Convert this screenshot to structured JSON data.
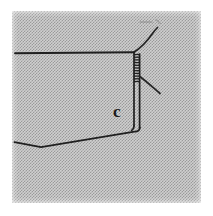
{
  "figure": {
    "kind": "scanned-line-drawing",
    "caption_label": "c",
    "background": {
      "paper_color": "#ffffff",
      "scan_field_color": "#cfcfcf",
      "dither_color": "#787878",
      "field_x": 12,
      "field_y": 11,
      "field_width": 189,
      "field_height": 192
    },
    "ink_color": "#1f1f1f",
    "faint_ink_color": "#8a8a8a",
    "parts": [
      {
        "name": "top-horizontal-edge",
        "description": "long dark horizontal line across upper area",
        "points": "15,53 133,52"
      },
      {
        "name": "zipper-stitch-column",
        "description": "two close parallel vertical lines with short horizontal rungs, zipper/stitching",
        "x_left": 133,
        "x_right": 140,
        "y_top": 53,
        "y_bottom": 82,
        "rung_count": 11
      },
      {
        "name": "inner-vertical-edge",
        "description": "vertical line continuing down from the stitch column",
        "points": "134,82 134,126"
      },
      {
        "name": "outer-vertical-edge",
        "description": "second vertical line just right of inner edge",
        "points": "140,60 140,128"
      },
      {
        "name": "bottom-right-corner",
        "description": "rounded corner where verticals turn into the lower edge",
        "points": "140,128 136,132 132,131"
      },
      {
        "name": "lower-slanted-edge",
        "description": "long slanted edge from corner down-left to the V vertex",
        "points": "132,131 41,147"
      },
      {
        "name": "left-tail-edge",
        "description": "short edge rising left from the V vertex",
        "points": "41,147 14,142"
      },
      {
        "name": "upper-curved-thread",
        "description": "curve sweeping up and right from the top corner",
        "points": "134,52 143,44 150,36 155,31 158,28"
      },
      {
        "name": "lower-branch-thread",
        "description": "straight diagonal thread branching down-right from the stitch column",
        "points": "139,77 160,93"
      },
      {
        "name": "faint-top-dash",
        "description": "faint short horizontal mark near the top",
        "points": "140,22 152,22"
      },
      {
        "name": "faint-top-tick",
        "description": "faint short diagonal tick near the top right",
        "points": "156,19 160,23"
      },
      {
        "name": "label-c",
        "description": "bold lowercase letter c reference label",
        "text": "c",
        "x": 113,
        "y": 103
      }
    ]
  }
}
